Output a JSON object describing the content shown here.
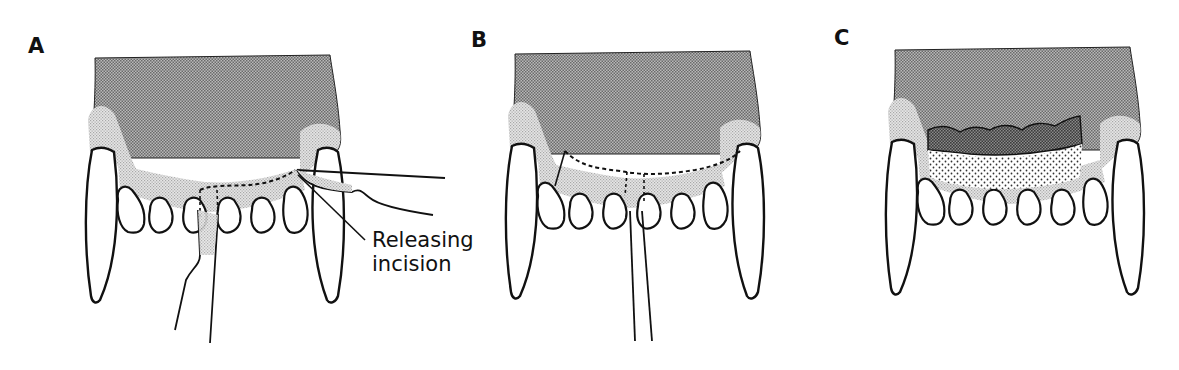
{
  "figure": {
    "panels": [
      {
        "label": "A",
        "callout": {
          "line1": "Releasing",
          "line2": "incision"
        }
      },
      {
        "label": "B"
      },
      {
        "label": "C"
      }
    ]
  },
  "colors": {
    "outline": "#111111",
    "dense_stipple": "#8e8e8e",
    "light_stipple": "#d2d2d2",
    "dark_flap": "#6e6e6e",
    "dot_fill": "#444444"
  }
}
